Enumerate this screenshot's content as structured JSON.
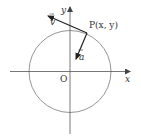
{
  "diagram": {
    "type": "unit-circle-vector-diagram",
    "colors": {
      "background": "#ffffff",
      "axis": "#555555",
      "circle": "#777777",
      "vector": "#222222",
      "text": "#333333"
    },
    "labels": {
      "y_axis": "y",
      "x_axis": "x",
      "origin": "O",
      "point": "P(x, y)",
      "vector_v": "v",
      "vector_a": "a",
      "vector_arrow": "→"
    },
    "geometry": {
      "origin": [
        70,
        71
      ],
      "circle_radius": 41,
      "point_P": [
        87,
        33
      ],
      "vector_v_end": [
        47,
        15
      ],
      "vector_a_end": [
        76,
        59
      ]
    }
  }
}
